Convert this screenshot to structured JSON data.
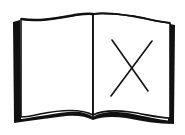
{
  "illustration": {
    "subject": "open-book-with-x-mark",
    "stroke_color": "#111111",
    "background_color": "#ffffff"
  }
}
